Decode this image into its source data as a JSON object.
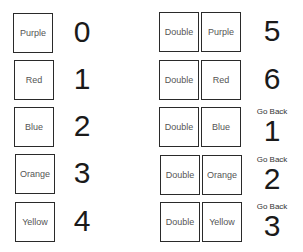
{
  "left_column": [
    {
      "color": "Purple",
      "number": "0"
    },
    {
      "color": "Red",
      "number": "1"
    },
    {
      "color": "Blue",
      "number": "2"
    },
    {
      "color": "Orange",
      "number": "3"
    },
    {
      "color": "Yellow",
      "number": "4"
    }
  ],
  "right_column": [
    {
      "modifier": "Double",
      "color": "Purple",
      "prefix": "",
      "number": "5"
    },
    {
      "modifier": "Double",
      "color": "Red",
      "prefix": "",
      "number": "6"
    },
    {
      "modifier": "Double",
      "color": "Blue",
      "prefix": "Go Back",
      "number": "1"
    },
    {
      "modifier": "Double",
      "color": "Orange",
      "prefix": "Go Back",
      "number": "2"
    },
    {
      "modifier": "Double",
      "color": "Yellow",
      "prefix": "Go Back",
      "number": "3"
    }
  ]
}
